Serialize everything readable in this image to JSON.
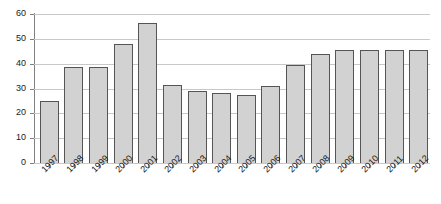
{
  "chart_data": {
    "type": "bar",
    "title": "",
    "subtitle": "",
    "xlabel": "",
    "ylabel": "",
    "categories": [
      "1997",
      "1998",
      "1999",
      "2000",
      "2001",
      "2002",
      "2003",
      "2004",
      "2005",
      "2006",
      "2007",
      "2008",
      "2009",
      "2010",
      "2011",
      "2012"
    ],
    "values": [
      25,
      38.5,
      38.5,
      48,
      56.5,
      31.5,
      29,
      28,
      27.5,
      31,
      39.5,
      44,
      45.5,
      45.5,
      45.5,
      45.5
    ],
    "series": [
      {
        "name": "Series 1",
        "values": [
          25,
          38.5,
          38.5,
          48,
          56.5,
          31.5,
          29,
          28,
          27.5,
          31,
          39.5,
          44,
          45.5,
          45.5,
          45.5,
          45.5
        ]
      }
    ],
    "ylim": [
      0,
      60
    ],
    "yticks": [
      0,
      10,
      20,
      30,
      40,
      50,
      60
    ],
    "ytick_labels": [
      "0",
      "10",
      "20",
      "30",
      "40",
      "50",
      "60"
    ],
    "grid": true,
    "grid_axis": "y",
    "legend": false,
    "legend_position": "none",
    "xtick_label_rotation": -45,
    "bar_fill_color": "#d2d2d2",
    "bar_border_color": "#555555",
    "gridline_color": "#c8c8c8",
    "axis_color": "#808080",
    "background_color": "#ffffff"
  }
}
